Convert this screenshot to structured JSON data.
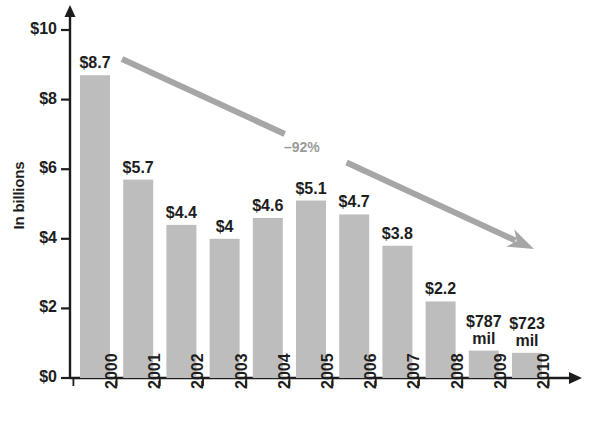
{
  "chart_data": {
    "type": "bar",
    "title": "",
    "xlabel": "",
    "ylabel": "In billions",
    "categories": [
      "2000",
      "2001",
      "2002",
      "2003",
      "2004",
      "2005",
      "2006",
      "2007",
      "2008",
      "2009",
      "2010"
    ],
    "values": [
      8.7,
      5.7,
      4.4,
      4.0,
      4.6,
      5.1,
      4.7,
      3.8,
      2.2,
      0.787,
      0.723
    ],
    "value_labels": [
      "$8.7",
      "$5.7",
      "$4.4",
      "$4",
      "$4.6",
      "$5.1",
      "$4.7",
      "$3.8",
      "$2.2",
      "$787 mil",
      "$723 mil"
    ],
    "ylim": [
      0,
      10
    ],
    "yticks": [
      0,
      2,
      4,
      6,
      8,
      10
    ],
    "ytick_labels": [
      "$0",
      "$2",
      "$4",
      "$6",
      "$8",
      "$10"
    ],
    "grid": false,
    "legend": null,
    "annotations": [
      {
        "text": "–92%",
        "type": "trend-arrow-label"
      }
    ],
    "colors": {
      "bar_fill": "#bdbdbd",
      "axis": "#1d1d1d",
      "arrow": "#a6a6a6",
      "text": "#1d1d1d",
      "annotation_text": "#9a9a9a",
      "background": "#ffffff"
    }
  }
}
